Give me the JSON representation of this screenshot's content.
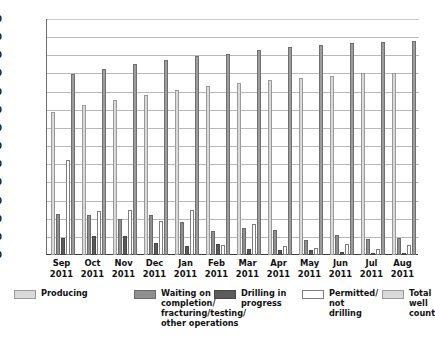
{
  "chart_data": {
    "type": "bar",
    "title": "",
    "xlabel": "",
    "ylabel": "",
    "ylim": [
      0,
      2600
    ],
    "ytick_step": 200,
    "grid": true,
    "legend_position": "bottom",
    "categories": [
      "Sep\n2011",
      "Oct\n2011",
      "Nov\n2011",
      "Dec\n2011",
      "Jan\n2011",
      "Feb\n2011",
      "Mar\n2011",
      "Apr\n2011",
      "May\n2011",
      "Jun\n2011",
      "Jul\n2011",
      "Aug\n2011"
    ],
    "ytick_labels": [
      "2,600",
      "2,400",
      "2,200",
      "2,000",
      "1,800",
      "1,600",
      "1,400",
      "1,200",
      "1,000",
      "800",
      "600",
      "400",
      "200",
      "0"
    ],
    "series": [
      {
        "name": "Producing",
        "color": "#d9d9d9",
        "values": [
          1580,
          1655,
          1705,
          1760,
          1820,
          1865,
          1895,
          1930,
          1950,
          1970,
          2000,
          2010
        ]
      },
      {
        "name": "Waiting on completion/ fracturing/testing/ other operations",
        "color": "#8f8f8f",
        "values": [
          455,
          445,
          395,
          445,
          360,
          260,
          300,
          280,
          160,
          225,
          175,
          185
        ]
      },
      {
        "name": "Drilling in progress",
        "color": "#5b5b5b",
        "values": [
          185,
          205,
          205,
          130,
          100,
          120,
          70,
          55,
          55,
          30,
          20,
          10
        ]
      },
      {
        "name": "Permitted/ not drilling",
        "color": "#ffffff",
        "values": [
          1050,
          490,
          500,
          370,
          500,
          110,
          340,
          100,
          80,
          125,
          70,
          110
        ]
      },
      {
        "name": "Total well count",
        "color": "#9d9d9d",
        "values": [
          1995,
          2045,
          2100,
          2150,
          2190,
          2220,
          2260,
          2290,
          2315,
          2335,
          2350,
          2360
        ]
      }
    ]
  },
  "legend": {
    "items": [
      {
        "label": "Producing",
        "swatch": "#d9d9d9",
        "border": "#9a9a9a"
      },
      {
        "label": "Waiting on\ncompletion/\nfracturing/testing/\nother operations",
        "swatch": "#8f8f8f",
        "border": "#6a6a6a"
      },
      {
        "label": "Drilling in\nprogress",
        "swatch": "#5b5b5b",
        "border": "#474747"
      },
      {
        "label": "Permitted/\nnot drilling",
        "swatch": "#ffffff",
        "border": "#7d7d7d"
      },
      {
        "label": "Total\nwell\ncount",
        "swatch": "#d9d9d9",
        "border": "#9a9a9a"
      }
    ]
  }
}
